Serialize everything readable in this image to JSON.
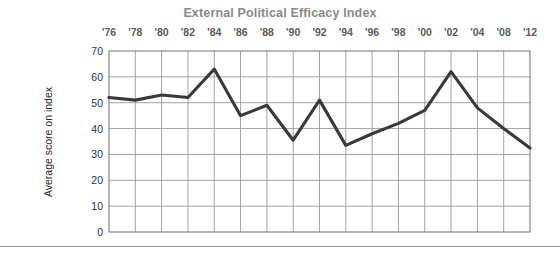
{
  "chart_data": {
    "type": "line",
    "title": "External Political Efficacy Index",
    "xlabel": "",
    "ylabel": "Average score on index",
    "categories": [
      "'76",
      "'78",
      "'80",
      "'82",
      "'84",
      "'86",
      "'88",
      "'90",
      "'92",
      "'94",
      "'96",
      "'98",
      "'00",
      "'02",
      "'04",
      "'08",
      "'12"
    ],
    "values": [
      52,
      51,
      53,
      52,
      63,
      45,
      49,
      35.5,
      51,
      33.5,
      38,
      42,
      47,
      62,
      48,
      40,
      32.5
    ],
    "ylim": [
      0,
      70
    ],
    "ytick_values": [
      0,
      10,
      20,
      30,
      40,
      50,
      60,
      70
    ],
    "ytick_labels": [
      "0",
      "10",
      "20",
      "30",
      "40",
      "50",
      "60",
      "70"
    ],
    "grid": true,
    "grid_axis": "both",
    "legend": false,
    "legend_position": "none",
    "xaxis_label_position": "top",
    "series": [
      {
        "name": "External Political Efficacy Index",
        "values": [
          52,
          51,
          53,
          52,
          63,
          45,
          49,
          35.5,
          51,
          33.5,
          38,
          42,
          47,
          62,
          48,
          40,
          32.5
        ]
      }
    ]
  },
  "colors": {
    "title": "#8a8a8a",
    "line": "#3a3a3a",
    "grid": "#999999",
    "plot_border": "#6f6f6f",
    "tick_label": "#333333",
    "x_tick_label": "#5c5c5c",
    "axis_title": "#2b2b2b",
    "background": "#ffffff",
    "rule": "#9a9a9a"
  },
  "figure": {
    "plot_left": 109,
    "plot_right": 530,
    "plot_top": 51,
    "plot_bottom": 232
  }
}
